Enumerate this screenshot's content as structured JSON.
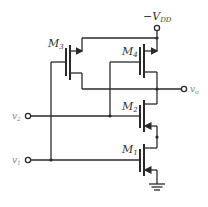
{
  "diagram": {
    "type": "circuit-schematic",
    "supply": {
      "label": "−V",
      "subscript": "DD"
    },
    "output": {
      "label": "v",
      "subscript": "o"
    },
    "inputs": [
      {
        "label": "v",
        "subscript": "2"
      },
      {
        "label": "v",
        "subscript": "1"
      }
    ],
    "transistors": [
      {
        "id": "M3",
        "label": "M",
        "subscript": "3"
      },
      {
        "id": "M4",
        "label": "M",
        "subscript": "4"
      },
      {
        "id": "M2",
        "label": "M",
        "subscript": "2"
      },
      {
        "id": "M1",
        "label": "M",
        "subscript": "1"
      }
    ],
    "ground": "ground-symbol"
  }
}
